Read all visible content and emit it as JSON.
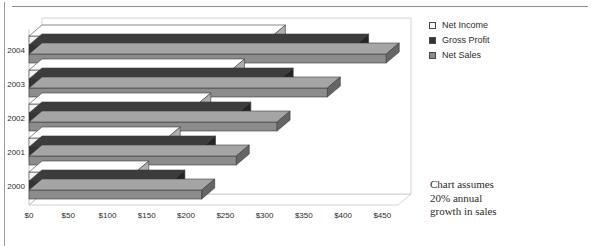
{
  "chart_data": {
    "type": "bar",
    "orientation": "horizontal",
    "style": "3d-clustered-bar",
    "title": "",
    "xlabel": "",
    "ylabel": "",
    "categories": [
      "2004",
      "2003",
      "2002",
      "2001",
      "2000"
    ],
    "series": [
      {
        "name": "Net Income",
        "values": [
          310,
          258,
          215,
          176,
          136
        ],
        "color": "#f2f2f2"
      },
      {
        "name": "Gross Profit",
        "values": [
          416,
          320,
          266,
          221,
          182
        ],
        "color": "#333333"
      },
      {
        "name": "Net Sales",
        "values": [
          455,
          380,
          316,
          264,
          220
        ],
        "color": "#8c8c8c"
      }
    ],
    "xticks": [
      "$0",
      "$50",
      "$100",
      "$150",
      "$200",
      "$250",
      "$300",
      "$350",
      "$400",
      "$450"
    ],
    "xtick_values": [
      0,
      50,
      100,
      150,
      200,
      250,
      300,
      350,
      400,
      450
    ],
    "xlim": [
      0,
      470
    ],
    "grid": false,
    "legend_position": "right",
    "annotation": "Chart assumes 20% annual growth in sales"
  },
  "legend": {
    "items": [
      {
        "label": "Net Income",
        "swatch": "#f7f7f7"
      },
      {
        "label": "Gross Profit",
        "swatch": "#333333"
      },
      {
        "label": "Net Sales",
        "swatch": "#8c8c8c"
      }
    ]
  },
  "note": {
    "line1": "Chart assumes",
    "line2": "20% annual",
    "line3": "growth in sales"
  },
  "axis": {
    "year_labels": [
      "2004",
      "2003",
      "2002",
      "2001",
      "2000"
    ],
    "tick_labels": [
      "$0",
      "$50",
      "$100",
      "$150",
      "$200",
      "$250",
      "$300",
      "$350",
      "$400",
      "$450"
    ]
  },
  "colors": {
    "net_income": "#f7f7f7",
    "gross_profit": "#333333",
    "net_sales": "#8c8c8c",
    "axis_line": "#9a9a9a",
    "text": "#2b2b2b",
    "rule": "#8d8d8d"
  }
}
